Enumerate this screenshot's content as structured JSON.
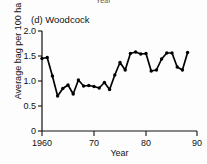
{
  "figure": {
    "cut_off_label_above": "Year",
    "panel_title": "(d) Woodcock"
  },
  "axes": {
    "y_label": "Average bag per 100 ha",
    "x_label": "Year",
    "y_ticks": [
      "0",
      "0.5",
      "1.0",
      "1.5",
      "2.0"
    ],
    "x_ticks": [
      "1960",
      "70",
      "80",
      "90"
    ]
  },
  "chart_data": {
    "type": "line",
    "title": "(d) Woodcock",
    "xlabel": "Year",
    "ylabel": "Average bag per 100 ha",
    "xlim": [
      1960,
      1990
    ],
    "ylim": [
      0,
      2.0
    ],
    "xticks": [
      1960,
      1970,
      1980,
      1990
    ],
    "xticklabels": [
      "1960",
      "70",
      "80",
      "90"
    ],
    "yticks": [
      0,
      0.5,
      1.0,
      1.5,
      2.0
    ],
    "yticklabels": [
      "0",
      "0.5",
      "1.0",
      "1.5",
      "2.0"
    ],
    "grid": false,
    "legend": null,
    "marker": "filled-circle",
    "line_color": "#000000",
    "series": [
      {
        "name": "Woodcock average bag per 100 ha",
        "x": [
          1960,
          1961,
          1962,
          1963,
          1964,
          1965,
          1966,
          1967,
          1968,
          1969,
          1970,
          1971,
          1972,
          1973,
          1974,
          1975,
          1976,
          1977,
          1978,
          1979,
          1980,
          1981,
          1982,
          1983,
          1984,
          1985,
          1986,
          1987,
          1988
        ],
        "values": [
          1.45,
          1.47,
          1.1,
          0.7,
          0.85,
          0.92,
          0.74,
          1.02,
          0.9,
          0.91,
          0.89,
          0.86,
          0.97,
          0.83,
          1.12,
          1.37,
          1.22,
          1.55,
          1.58,
          1.54,
          1.55,
          1.2,
          1.22,
          1.44,
          1.56,
          1.56,
          1.28,
          1.22,
          1.57
        ]
      }
    ]
  },
  "geometry": {
    "x_pixel_1960": 42,
    "x_pixel_per_year": 5.2,
    "y_pixel_zero": 131,
    "y_pixel_per_unit": 50
  }
}
